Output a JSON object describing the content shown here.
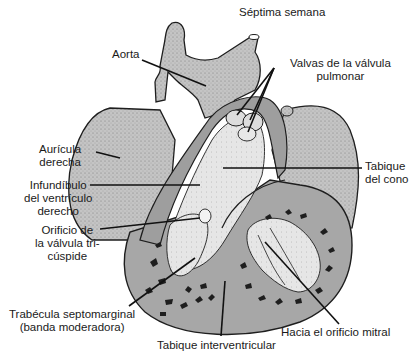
{
  "figure": {
    "title": "Séptima semana",
    "colors": {
      "tissue_gray": "#b9b9b9",
      "cut_section_gray": "#a3a3a3",
      "outline": "#1e1e1e",
      "lumen_white": "#f4f4f4",
      "background": "#ffffff"
    },
    "labels": {
      "aorta": "Aorta",
      "pulmonary_valves": [
        "Valvas de la válvula",
        "pulmonar"
      ],
      "right_atrium": [
        "Aurícula",
        "derecha"
      ],
      "conus_septum": [
        "Tabique",
        "del cono"
      ],
      "infundibulum": [
        "Infundíbulo",
        "del ventrículo",
        "derecho"
      ],
      "tricuspid_orifice": [
        "Orificio de",
        "la válvula tri-",
        "cúspide"
      ],
      "septomarginal_trabecula": [
        "Trabécula septomarginal",
        "(banda moderadora)"
      ],
      "interventricular_septum": "Tabique interventricular",
      "mitral_orifice": "Hacia el orificio mitral"
    }
  }
}
